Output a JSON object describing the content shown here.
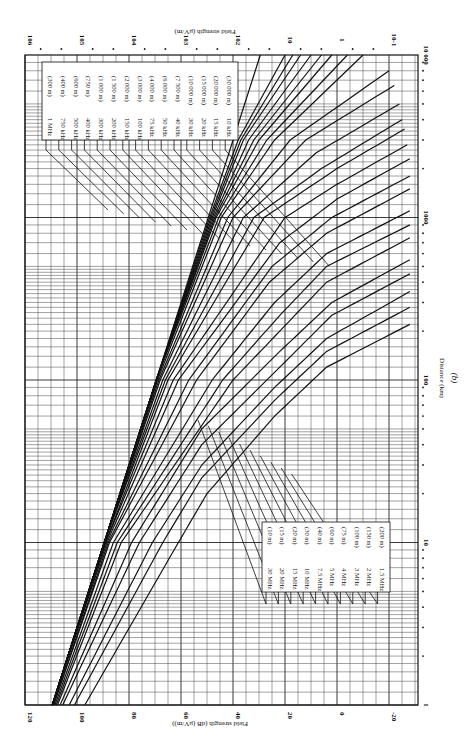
{
  "chart_data": {
    "type": "line",
    "title": "",
    "caption": "(b)",
    "orientation": "rotated 90° clockwise (distance axis vertical at right, field-strength axis horizontal)",
    "xlabel": "Distance (km)",
    "ylabel": "Field strength (dB (μV/m))",
    "ylabel_secondary": "Field strength (μV/m)",
    "x_scale": "log",
    "xlim": [
      1,
      10000
    ],
    "x_ticks": [
      "1",
      "10",
      "100",
      "1000",
      "10 000"
    ],
    "ylim": [
      -30,
      120
    ],
    "y_ticks": [
      "120",
      "100",
      "80",
      "60",
      "40",
      "20",
      "0",
      "-20"
    ],
    "y_ticks_secondary": [
      "10^6",
      "10^5",
      "10^4",
      "10^3",
      "10^2",
      "10",
      "1",
      "10^-1"
    ],
    "grid": true,
    "legend_groups": [
      {
        "position": "upper (far distance side)",
        "entries": [
          {
            "freq": "1 MHz",
            "wavelength": "(300 m)"
          },
          {
            "freq": "750 kHz",
            "wavelength": "(400 m)"
          },
          {
            "freq": "500 kHz",
            "wavelength": "(600 m)"
          },
          {
            "freq": "400 kHz",
            "wavelength": "(750 m)"
          },
          {
            "freq": "300 kHz",
            "wavelength": "(1 000 m)"
          },
          {
            "freq": "200 kHz",
            "wavelength": "(1 500 m)"
          },
          {
            "freq": "150 kHz",
            "wavelength": "(2 000 m)"
          },
          {
            "freq": "100 kHz",
            "wavelength": "(3 000 m)"
          },
          {
            "freq": "75 kHz",
            "wavelength": "(4 000 m)"
          },
          {
            "freq": "50 kHz",
            "wavelength": "(6 000 m)"
          },
          {
            "freq": "40 kHz",
            "wavelength": "(7 500 m)"
          },
          {
            "freq": "30 kHz",
            "wavelength": "(10 000 m)"
          },
          {
            "freq": "20 kHz",
            "wavelength": "(15 000 m)"
          },
          {
            "freq": "15 kHz",
            "wavelength": "(20 000 m)"
          },
          {
            "freq": "10 kHz",
            "wavelength": "(30 000 m)"
          }
        ]
      },
      {
        "position": "lower (near distance side)",
        "entries": [
          {
            "freq": "30 MHz",
            "wavelength": "(10 m)"
          },
          {
            "freq": "20 MHz",
            "wavelength": "(15 m)"
          },
          {
            "freq": "15 MHz",
            "wavelength": "(20 m)"
          },
          {
            "freq": "10 MHz",
            "wavelength": "(30 m)"
          },
          {
            "freq": "7.5 MHz",
            "wavelength": "(40 m)"
          },
          {
            "freq": "5 MHz",
            "wavelength": "(60 m)"
          },
          {
            "freq": "4 MHz",
            "wavelength": "(75 m)"
          },
          {
            "freq": "3 MHz",
            "wavelength": "(100 m)"
          },
          {
            "freq": "2 MHz",
            "wavelength": "(150 m)"
          },
          {
            "freq": "1.5 MHz",
            "wavelength": "(200 m)"
          }
        ]
      }
    ],
    "reference_line": {
      "name": "inverse distance (1/d)",
      "points": [
        [
          1,
          109.5
        ],
        [
          10000,
          29.5
        ]
      ]
    },
    "series_note": "Ground-wave field strength curves; approximate values read from plot (dB μV/m at distance km)",
    "series": [
      {
        "name": "10 kHz",
        "x": [
          1,
          10,
          100,
          1000,
          3000,
          10000
        ],
        "y": [
          109.5,
          89.5,
          69.5,
          49,
          38,
          20
        ]
      },
      {
        "name": "15 kHz",
        "x": [
          1,
          10,
          100,
          1000,
          3000,
          10000
        ],
        "y": [
          109.5,
          89.5,
          69.5,
          48.5,
          37,
          17
        ]
      },
      {
        "name": "20 kHz",
        "x": [
          1,
          10,
          100,
          1000,
          3000,
          10000
        ],
        "y": [
          109.5,
          89.5,
          69.5,
          48,
          36,
          14
        ]
      },
      {
        "name": "30 kHz",
        "x": [
          1,
          10,
          100,
          1000,
          3000,
          10000
        ],
        "y": [
          109.5,
          89.5,
          69.5,
          47.5,
          34,
          10
        ]
      },
      {
        "name": "40 kHz",
        "x": [
          1,
          10,
          100,
          1000,
          3000,
          10000
        ],
        "y": [
          109.5,
          89.5,
          69.5,
          47,
          32,
          6
        ]
      },
      {
        "name": "50 kHz",
        "x": [
          1,
          10,
          100,
          1000,
          3000,
          10000
        ],
        "y": [
          109.5,
          89.5,
          69.5,
          46.5,
          30,
          2
        ]
      },
      {
        "name": "75 kHz",
        "x": [
          1,
          10,
          100,
          1000,
          3000,
          10000
        ],
        "y": [
          109.5,
          89.5,
          69.5,
          45.5,
          27,
          -4
        ]
      },
      {
        "name": "100 kHz",
        "x": [
          1,
          10,
          100,
          1000,
          3000,
          10000
        ],
        "y": [
          109.5,
          89.5,
          69,
          44.5,
          24,
          -10
        ]
      },
      {
        "name": "150 kHz",
        "x": [
          1,
          10,
          100,
          1000,
          3000,
          8000
        ],
        "y": [
          109.5,
          89.5,
          68.5,
          42,
          18,
          -20
        ]
      },
      {
        "name": "200 kHz",
        "x": [
          1,
          10,
          100,
          1000,
          3000,
          6500
        ],
        "y": [
          109.5,
          89.5,
          68,
          40,
          12,
          -22
        ]
      },
      {
        "name": "300 kHz",
        "x": [
          1,
          10,
          100,
          1000,
          2500,
          5000
        ],
        "y": [
          109.5,
          89.5,
          67,
          36,
          8,
          -24
        ]
      },
      {
        "name": "400 kHz",
        "x": [
          1,
          10,
          100,
          1000,
          2000,
          4000
        ],
        "y": [
          109.5,
          89.5,
          66,
          32,
          6,
          -25
        ]
      },
      {
        "name": "500 kHz",
        "x": [
          1,
          10,
          100,
          1000,
          2000,
          3500
        ],
        "y": [
          109.5,
          89,
          65,
          28,
          0,
          -26
        ]
      },
      {
        "name": "750 kHz",
        "x": [
          1,
          10,
          100,
          1000,
          1600,
          2800
        ],
        "y": [
          109.5,
          89,
          63,
          20,
          0,
          -27
        ]
      },
      {
        "name": "1 MHz",
        "x": [
          1,
          10,
          100,
          700,
          1300,
          2300
        ],
        "y": [
          109.5,
          88.5,
          61,
          22,
          0,
          -28
        ]
      },
      {
        "name": "1.5 MHz",
        "x": [
          1,
          10,
          100,
          500,
          1000,
          1800
        ],
        "y": [
          109,
          88,
          57,
          25,
          2,
          -28
        ]
      },
      {
        "name": "2 MHz",
        "x": [
          1,
          10,
          100,
          400,
          800,
          1500
        ],
        "y": [
          109,
          87.5,
          54,
          26,
          4,
          -28
        ]
      },
      {
        "name": "3 MHz",
        "x": [
          1,
          10,
          100,
          300,
          600,
          1100
        ],
        "y": [
          108.5,
          86,
          48,
          24,
          4,
          -28
        ]
      },
      {
        "name": "4 MHz",
        "x": [
          1,
          10,
          100,
          250,
          500,
          900
        ],
        "y": [
          108,
          84.5,
          44,
          22,
          4,
          -28
        ]
      },
      {
        "name": "5 MHz",
        "x": [
          1,
          10,
          100,
          200,
          400,
          750
        ],
        "y": [
          107.5,
          83,
          40,
          22,
          4,
          -28
        ]
      },
      {
        "name": "7.5 MHz",
        "x": [
          1,
          10,
          50,
          150,
          300,
          550
        ],
        "y": [
          106.5,
          79,
          52,
          22,
          2,
          -28
        ]
      },
      {
        "name": "10 MHz",
        "x": [
          1,
          10,
          40,
          120,
          250,
          450
        ],
        "y": [
          105.5,
          76,
          52,
          22,
          2,
          -28
        ]
      },
      {
        "name": "15 MHz",
        "x": [
          1,
          10,
          30,
          90,
          180,
          350
        ],
        "y": [
          103,
          71,
          52,
          24,
          4,
          -28
        ]
      },
      {
        "name": "20 MHz",
        "x": [
          1,
          10,
          25,
          75,
          150,
          280
        ],
        "y": [
          101,
          67,
          52,
          24,
          4,
          -28
        ]
      },
      {
        "name": "30 MHz",
        "x": [
          1,
          10,
          20,
          60,
          120,
          220
        ],
        "y": [
          97,
          61,
          50,
          24,
          4,
          -28
        ]
      }
    ]
  },
  "labels": {
    "axis_title_bottom": "Field strength (dB (μV/m))",
    "axis_title_top": "Field strength (μV/m)",
    "axis_title_right": "Distance (km)",
    "caption": "(b)"
  }
}
